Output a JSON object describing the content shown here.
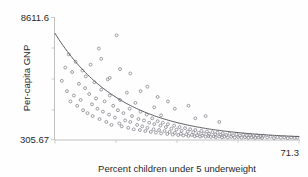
{
  "figure": {
    "background_color": "#fefefe",
    "marker_color": "#8d8d94",
    "curve_color": "#5d5d63",
    "axis_color": "#b9b9b9",
    "text_color": "#2a2a2a"
  },
  "chart_data": {
    "type": "scatter",
    "title": "",
    "subtitle": "",
    "xlabel": "Percent children under 5 underweight",
    "ylabel": "Per-capita GNP",
    "xlim": [
      0,
      71.3
    ],
    "ylim": [
      305.67,
      8611.6
    ],
    "x_tick_labels": [
      "71.3"
    ],
    "y_tick_labels": [
      "8611.6",
      "305.67"
    ],
    "y_tick_top": "8611.6",
    "y_tick_bottom": "305.67",
    "x_tick_max": "71.3",
    "grid": false,
    "legend": null,
    "annotations": [],
    "fit": {
      "type": "exponential-decay",
      "label": "",
      "description": "Smooth monotone decreasing curve fitted through the point cloud"
    },
    "points": [
      [
        2.0,
        4300
      ],
      [
        3.0,
        5200
      ],
      [
        3.5,
        3600
      ],
      [
        4.0,
        6100
      ],
      [
        4.5,
        2900
      ],
      [
        5.0,
        4900
      ],
      [
        5.5,
        3300
      ],
      [
        6.0,
        5600
      ],
      [
        6.5,
        2600
      ],
      [
        7.0,
        4100
      ],
      [
        7.5,
        3000
      ],
      [
        8.0,
        5000
      ],
      [
        8.2,
        2300
      ],
      [
        8.8,
        3800
      ],
      [
        9.0,
        4600
      ],
      [
        9.5,
        2100
      ],
      [
        10.0,
        3400
      ],
      [
        10.4,
        5400
      ],
      [
        10.8,
        2700
      ],
      [
        11.0,
        1900
      ],
      [
        11.5,
        4200
      ],
      [
        12.0,
        3100
      ],
      [
        12.4,
        2400
      ],
      [
        12.8,
        6500
      ],
      [
        13.0,
        1700
      ],
      [
        13.5,
        3700
      ],
      [
        14.0,
        2200
      ],
      [
        14.5,
        2900
      ],
      [
        15.0,
        1500
      ],
      [
        15.4,
        4400
      ],
      [
        15.8,
        2000
      ],
      [
        16.0,
        3300
      ],
      [
        16.5,
        1300
      ],
      [
        17.0,
        2600
      ],
      [
        17.5,
        1800
      ],
      [
        18.0,
        7400
      ],
      [
        18.4,
        2300
      ],
      [
        18.8,
        1400
      ],
      [
        19.0,
        3000
      ],
      [
        19.5,
        1200
      ],
      [
        20.0,
        2100
      ],
      [
        20.5,
        1600
      ],
      [
        21.0,
        3500
      ],
      [
        21.4,
        1100
      ],
      [
        21.8,
        2400
      ],
      [
        22.0,
        1500
      ],
      [
        22.5,
        1900
      ],
      [
        23.0,
        1000
      ],
      [
        23.5,
        2800
      ],
      [
        24.0,
        1300
      ],
      [
        24.4,
        1700
      ],
      [
        24.8,
        950
      ],
      [
        25.0,
        2200
      ],
      [
        25.5,
        1200
      ],
      [
        26.0,
        1600
      ],
      [
        26.4,
        880
      ],
      [
        26.8,
        2000
      ],
      [
        27.0,
        1100
      ],
      [
        27.5,
        1450
      ],
      [
        28.0,
        820
      ],
      [
        28.4,
        1750
      ],
      [
        28.8,
        1000
      ],
      [
        29.0,
        1350
      ],
      [
        29.5,
        780
      ],
      [
        30.0,
        1550
      ],
      [
        30.4,
        950
      ],
      [
        30.8,
        1250
      ],
      [
        31.0,
        720
      ],
      [
        31.5,
        1450
      ],
      [
        32.0,
        880
      ],
      [
        32.4,
        1150
      ],
      [
        32.8,
        680
      ],
      [
        33.0,
        1350
      ],
      [
        33.5,
        820
      ],
      [
        34.0,
        1050
      ],
      [
        34.4,
        640
      ],
      [
        34.8,
        1250
      ],
      [
        35.0,
        760
      ],
      [
        35.5,
        980
      ],
      [
        36.0,
        610
      ],
      [
        36.4,
        1150
      ],
      [
        36.8,
        700
      ],
      [
        37.0,
        900
      ],
      [
        37.5,
        580
      ],
      [
        38.0,
        1080
      ],
      [
        38.4,
        660
      ],
      [
        38.8,
        850
      ],
      [
        39.0,
        550
      ],
      [
        39.5,
        1000
      ],
      [
        40.0,
        620
      ],
      [
        40.4,
        800
      ],
      [
        40.8,
        530
      ],
      [
        41.0,
        950
      ],
      [
        41.5,
        590
      ],
      [
        42.0,
        760
      ],
      [
        42.4,
        510
      ],
      [
        42.8,
        900
      ],
      [
        43.0,
        570
      ],
      [
        43.5,
        720
      ],
      [
        44.0,
        495
      ],
      [
        44.4,
        850
      ],
      [
        44.8,
        550
      ],
      [
        45.0,
        690
      ],
      [
        45.5,
        480
      ],
      [
        46.0,
        810
      ],
      [
        46.4,
        530
      ],
      [
        46.8,
        660
      ],
      [
        47.0,
        465
      ],
      [
        47.5,
        770
      ],
      [
        48.0,
        515
      ],
      [
        48.4,
        630
      ],
      [
        48.8,
        455
      ],
      [
        49.0,
        730
      ],
      [
        49.5,
        500
      ],
      [
        50.0,
        610
      ],
      [
        50.5,
        445
      ],
      [
        51.0,
        700
      ],
      [
        51.5,
        490
      ],
      [
        52.0,
        590
      ],
      [
        52.5,
        435
      ],
      [
        53.0,
        670
      ],
      [
        53.5,
        475
      ],
      [
        54.0,
        570
      ],
      [
        54.5,
        430
      ],
      [
        55.0,
        640
      ],
      [
        55.5,
        465
      ],
      [
        56.0,
        550
      ],
      [
        56.5,
        420
      ],
      [
        57.0,
        610
      ],
      [
        57.5,
        455
      ],
      [
        58.0,
        530
      ],
      [
        58.5,
        415
      ],
      [
        59.0,
        580
      ],
      [
        59.5,
        445
      ],
      [
        60.0,
        515
      ],
      [
        60.5,
        410
      ],
      [
        61.0,
        560
      ],
      [
        62.0,
        440
      ],
      [
        63.0,
        500
      ],
      [
        64.0,
        405
      ],
      [
        65.0,
        470
      ],
      [
        66.0,
        430
      ],
      [
        67.0,
        455
      ],
      [
        68.0,
        400
      ],
      [
        69.0,
        440
      ],
      [
        70.0,
        420
      ],
      [
        70.8,
        435
      ],
      [
        30.0,
        3200
      ],
      [
        33.0,
        2900
      ],
      [
        39.0,
        2600
      ],
      [
        44.0,
        1900
      ],
      [
        48.0,
        1500
      ],
      [
        22.0,
        4800
      ],
      [
        27.0,
        3900
      ],
      [
        19.0,
        5100
      ],
      [
        16.0,
        4500
      ],
      [
        13.5,
        5800
      ],
      [
        35.0,
        2400
      ],
      [
        41.0,
        1750
      ],
      [
        25.0,
        3600
      ],
      [
        29.0,
        2500
      ],
      [
        31.0,
        1950
      ]
    ]
  }
}
